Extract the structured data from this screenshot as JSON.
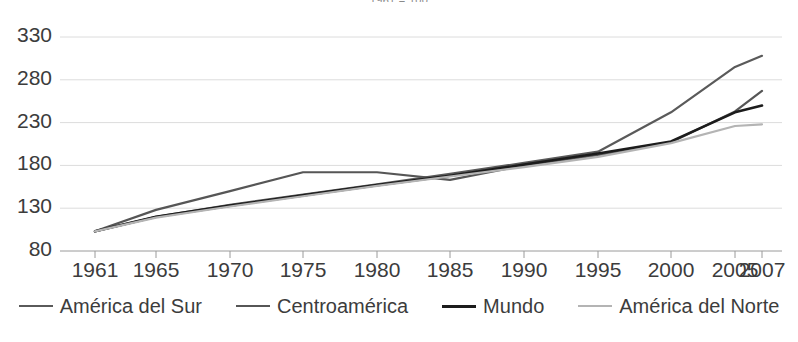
{
  "chart_data": {
    "type": "line",
    "title": "1961 = 100",
    "xlabel": "",
    "ylabel": "",
    "grid": true,
    "legend_position": "bottom",
    "categories": [
      "1961",
      "1965",
      "1970",
      "1975",
      "1980",
      "1985",
      "1990",
      "1995",
      "2000",
      "2005",
      "2007"
    ],
    "xlim": [
      1961,
      2007
    ],
    "ylim": [
      80,
      330
    ],
    "yticks": [
      80,
      130,
      180,
      230,
      280,
      330
    ],
    "xticks": [
      "1961",
      "1965",
      "1970",
      "1975",
      "1980",
      "1985",
      "1990",
      "1995",
      "2000",
      "2005",
      "2007"
    ],
    "series": [
      {
        "name": "América del Sur",
        "color": "#5a5a5a",
        "width": 2.2,
        "values": [
          103,
          120,
          134,
          146,
          158,
          170,
          183,
          196,
          242,
          295,
          308
        ]
      },
      {
        "name": "Centroamérica",
        "color": "#565656",
        "width": 2.2,
        "values": [
          103,
          128,
          150,
          172,
          172,
          163,
          180,
          192,
          207,
          243,
          267
        ]
      },
      {
        "name": "Mundo",
        "color": "#1c1c1c",
        "width": 2.6,
        "values": [
          103,
          120,
          133,
          145,
          157,
          168,
          181,
          194,
          208,
          242,
          250
        ]
      },
      {
        "name": "América del Norte",
        "color": "#b4b4b4",
        "width": 2.2,
        "values": [
          103,
          119,
          132,
          144,
          156,
          167,
          178,
          190,
          206,
          226,
          228
        ]
      }
    ]
  },
  "axis": {
    "y_labels": [
      "330",
      "280",
      "230",
      "180",
      "130",
      "80"
    ],
    "x_labels": [
      "1961",
      "1965",
      "1970",
      "1975",
      "1980",
      "1985",
      "1990",
      "1995",
      "2000",
      "2005",
      "2007"
    ]
  },
  "legend": {
    "items": [
      {
        "label": "América del Sur",
        "color": "#5a5a5a",
        "width": "2.2px"
      },
      {
        "label": "Centroamérica",
        "color": "#565656",
        "width": "2.2px"
      },
      {
        "label": "Mundo",
        "color": "#1c1c1c",
        "width": "3px"
      },
      {
        "label": "América del Norte",
        "color": "#b4b4b4",
        "width": "2.2px"
      }
    ]
  },
  "style": {
    "grid_color": "#dcdcdc",
    "axis_color": "#9a9a9a",
    "background": "#ffffff",
    "text_color": "#3c3c3c"
  }
}
